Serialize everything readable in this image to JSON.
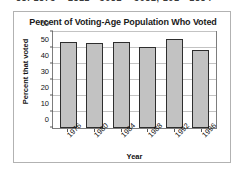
{
  "page": {
    "clipped_header_text": "88. 1875   +   2811   -  3082   +  3082, 101   -  1884"
  },
  "chart_data": {
    "type": "bar",
    "title": "Percent of Voting-Age Population Who Voted",
    "xlabel": "Year",
    "ylabel": "Percent that voted",
    "categories": [
      "1976",
      "1980",
      "1984",
      "1988",
      "1992",
      "1996"
    ],
    "values": [
      53.5,
      53,
      53.5,
      50.5,
      55.5,
      49
    ],
    "ylim": [
      0,
      60
    ],
    "yticks": [
      0,
      10,
      20,
      30,
      40,
      50,
      60
    ],
    "ytick_labels": [
      "0",
      "10",
      "20",
      "30",
      "40",
      "50",
      "60"
    ],
    "grid": true,
    "legend": "none",
    "bar_color": "#c2c2c2",
    "bar_border_color": "#2e2e2e",
    "gridline_color": "#c3c3c3",
    "axis_color": "#7d7d7d",
    "frame_color": "#b2b2b2"
  }
}
